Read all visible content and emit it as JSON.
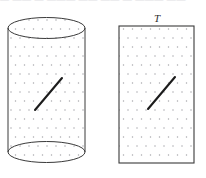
{
  "figure": {
    "top_cut_text": "— —— — ——— —— —— — ——— ——",
    "background_color": "#ffffff",
    "stroke_color": "#3a3a3a",
    "dot_color": "#a8a8ac",
    "segment_color": "#1c1c1c",
    "cylinder": {
      "name": "cylinder",
      "left": 8,
      "right": 85,
      "top_center_y": 28,
      "bottom_center_y": 152,
      "ellipse_ry": 10.5,
      "segment": {
        "x1": 35,
        "y1": 110,
        "x2": 62,
        "y2": 78
      }
    },
    "rectangle": {
      "name": "rectangle",
      "label": "T",
      "label_x": 157,
      "label_y": 22,
      "left": 119,
      "top": 26,
      "right": 194,
      "bottom": 163,
      "segment": {
        "x1": 148,
        "y1": 109,
        "x2": 175,
        "y2": 77
      }
    },
    "dot_grid": {
      "spacing_x": 9,
      "spacing_y": 9,
      "row_offset_x": 4.5,
      "dot_radius": 0.75
    }
  }
}
